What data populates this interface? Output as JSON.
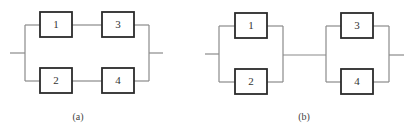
{
  "diagrams": [
    {
      "caption": "(a)",
      "description": "series-parallel: (1-3) in parallel with (2-4)",
      "blocks": [
        {
          "label": "1"
        },
        {
          "label": "3"
        },
        {
          "label": "2"
        },
        {
          "label": "4"
        }
      ]
    },
    {
      "caption": "(b)",
      "description": "parallel-series: (1||2) in series with (3||4)",
      "blocks": [
        {
          "label": "1"
        },
        {
          "label": "2"
        },
        {
          "label": "3"
        },
        {
          "label": "4"
        }
      ]
    }
  ],
  "colors": {
    "wire": "#8a8a8a",
    "box_border": "#2b2b2b",
    "text": "#333333"
  }
}
